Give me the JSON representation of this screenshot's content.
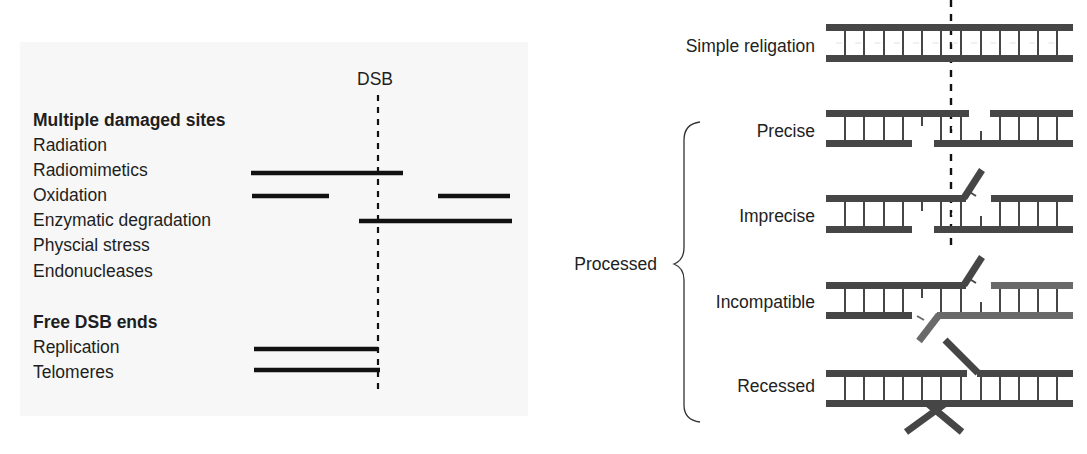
{
  "left_panel": {
    "dsb_label": "DSB",
    "section1_heading": "Multiple damaged sites",
    "section1_items": [
      "Radiation",
      "Radiomimetics",
      "Oxidation",
      "Enzymatic degradation",
      "Physcial stress",
      "Endonucleases"
    ],
    "section2_heading": "Free DSB ends",
    "section2_items": [
      "Replication",
      "Telomeres"
    ]
  },
  "right_panel": {
    "rows": [
      {
        "label": "Simple religation"
      },
      {
        "label": "Precise"
      },
      {
        "label": "Imprecise"
      },
      {
        "label": "Incompatible"
      },
      {
        "label": "Recessed"
      }
    ],
    "group_label": "Processed"
  },
  "colors": {
    "strand": "#464646",
    "strand_light": "#6a6a6a",
    "bar": "#111111",
    "panel_bg": "#f7f7f7"
  }
}
